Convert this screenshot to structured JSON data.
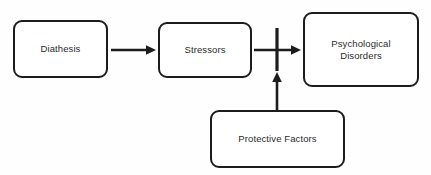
{
  "diagram": {
    "background_color": "#fefefe",
    "stroke_color": "#1c1c1c",
    "text_color": "#2b2b2b",
    "nodes": [
      {
        "id": "diathesis",
        "label": "Diathesis",
        "shape": "rounded-rectangle"
      },
      {
        "id": "stressors",
        "label": "Stressors",
        "shape": "rounded-rectangle"
      },
      {
        "id": "disorders",
        "label": "Psychological\nDisorders",
        "shape": "rounded-rectangle"
      },
      {
        "id": "protective",
        "label": "Protective Factors",
        "shape": "rounded-rectangle"
      }
    ],
    "edges": [
      {
        "id": "diathesis-to-stressors",
        "from": "diathesis",
        "to": "stressors",
        "style": "arrow",
        "direction": "right"
      },
      {
        "id": "stressors-to-disorders",
        "from": "stressors",
        "to": "disorders",
        "style": "arrow",
        "direction": "right",
        "blocked": true
      },
      {
        "id": "protective-to-link",
        "from": "protective",
        "to": "stressors-to-disorders",
        "style": "arrow",
        "direction": "up"
      }
    ],
    "markers": [
      {
        "id": "inhibition-bar",
        "type": "blocking-bar",
        "on_edge": "stressors-to-disorders"
      }
    ]
  }
}
